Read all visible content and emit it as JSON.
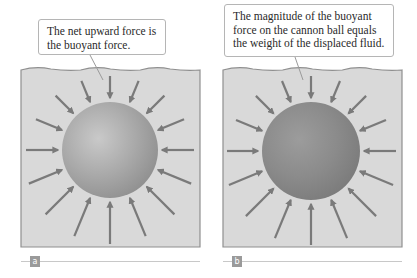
{
  "figure": {
    "panels": [
      {
        "id": "a",
        "label": "a",
        "callout": "The net upward force is the buoyant force.",
        "callout_box": {
          "x": 38,
          "y": 19,
          "w": 128,
          "h": 36
        },
        "tail": {
          "x1": 90,
          "y1": 55,
          "x2": 103,
          "y2": 80
        },
        "water": {
          "x": 21,
          "y": 68,
          "w": 179,
          "h": 179
        },
        "sphere": {
          "cx": 110,
          "cy": 150,
          "r": 48,
          "fill": "#a9a9a9",
          "highlight": "#c9c9c9",
          "shadow": "#8e8e8e"
        },
        "label_row": {
          "x": 21,
          "y": 256,
          "w": 179
        }
      },
      {
        "id": "b",
        "label": "b",
        "callout": "The magnitude of the buoyant force on the cannon ball equals the weight of the displaced fluid.",
        "callout_box": {
          "x": 224,
          "y": 4,
          "w": 170,
          "h": 53
        },
        "tail": {
          "x1": 295,
          "y1": 57,
          "x2": 303,
          "y2": 80
        },
        "water": {
          "x": 223,
          "y": 68,
          "w": 179,
          "h": 179
        },
        "sphere": {
          "cx": 311,
          "cy": 151,
          "r": 49,
          "fill": "#8b8b8b",
          "highlight": "#9c9c9c",
          "shadow": "#7a7a7a"
        },
        "label_row": {
          "x": 223,
          "y": 256,
          "w": 179
        }
      }
    ],
    "colors": {
      "water": "#d9d9d9",
      "water_border": "#8f8f8f",
      "arrow": "#7a7a7a",
      "callout_border": "#b5b5b5"
    },
    "arrows": {
      "count": 16,
      "inner_gap": 4,
      "length_top": 22,
      "length_bottom": 42
    }
  }
}
